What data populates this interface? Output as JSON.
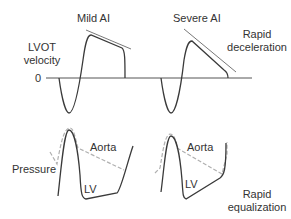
{
  "top_panel": {
    "y_label_line1": "LVOT",
    "y_label_line2": "velocity",
    "zero_label": "0",
    "mild_title": "Mild AI",
    "severe_title": "Severe AI",
    "severe_annotation_line1": "Rapid",
    "severe_annotation_line2": "deceleration"
  },
  "bottom_panel": {
    "y_label": "Pressure",
    "mild_aorta_label": "Aorta",
    "mild_lv_label": "LV",
    "severe_aorta_label": "Aorta",
    "severe_lv_label": "LV",
    "severe_annotation_line1": "Rapid",
    "severe_annotation_line2": "equalization"
  },
  "colors": {
    "trace": "#3a3a3a",
    "aorta_dashed": "#b0b0b0",
    "text": "#333333"
  }
}
